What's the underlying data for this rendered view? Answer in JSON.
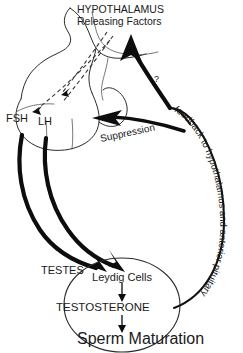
{
  "diagram": {
    "title_line1": "HYPOTHALAMUS",
    "title_line2": "Releasing Factors",
    "labels": {
      "fsh": "FSH",
      "lh": "LH",
      "suppression": "Suppression",
      "question_mark": "?",
      "feedback": "feedback to hypothalamus and anterior pituitary",
      "testes": "TESTES",
      "leydig_cells": "Leydig Cells",
      "testosterone": "TESTOSTERONE",
      "sperm_maturation": "Sperm Maturation"
    },
    "colors": {
      "ink": "#0d0d0d",
      "outline": "#2b2b2b",
      "thin_outline": "#555555",
      "background": "#ffffff"
    }
  }
}
